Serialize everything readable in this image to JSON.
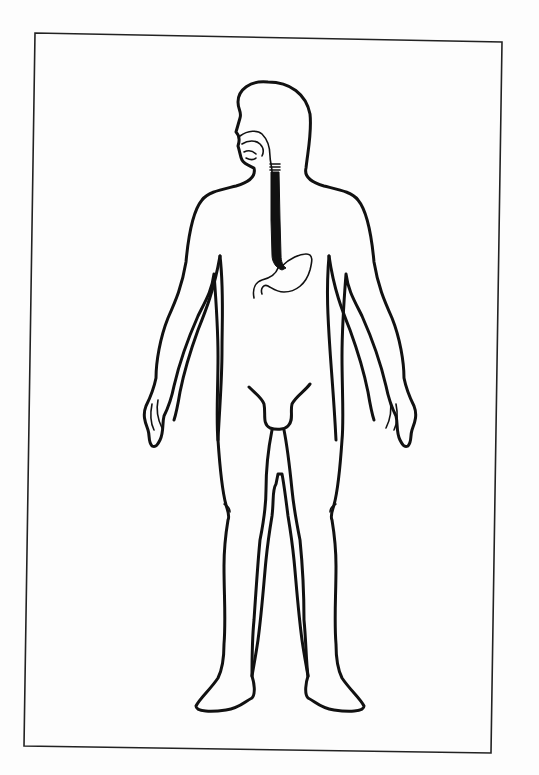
{
  "figure": {
    "title": "",
    "caption": "",
    "highlighted_organs": [
      "esophagus",
      "stomach"
    ],
    "colors": {
      "background": "#fdfdfd",
      "line": "#111111",
      "esophagus_fill": "#111111",
      "frame": "#222222"
    }
  }
}
